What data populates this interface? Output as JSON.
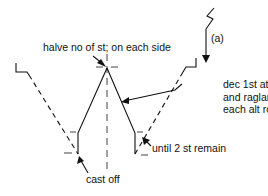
{
  "diagram": {
    "type": "knitting-shaping-schematic",
    "annotations": {
      "top": "halve no of st; on each side",
      "arrow_label": "(a)",
      "right_lines": [
        "dec 1st at neck",
        "and raglan edge",
        "each alt row"
      ],
      "bottom_right": "until 2 st remain",
      "bottom_left": "cast off"
    },
    "colors": {
      "line": "#111111",
      "background": "#ffffff"
    }
  }
}
